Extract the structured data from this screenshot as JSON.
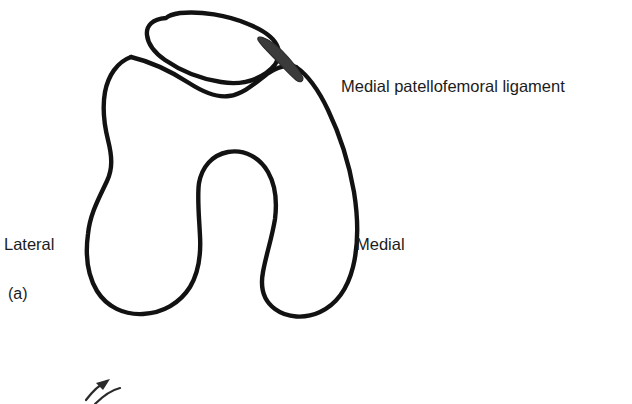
{
  "figure": {
    "panel_label": "(a)",
    "background_color": "#ffffff",
    "ink_color": "#121212",
    "ligament_color": "#3b3b3b",
    "width": 632,
    "height": 404
  },
  "labels": {
    "ligament": "Medial patellofemoral ligament",
    "lateral": "Lateral",
    "medial": "Medial"
  },
  "structures": {
    "patella": "patella",
    "femur": "distal-femur-axial-outline",
    "trochlear_groove": "trochlear-groove",
    "intercondylar_notch": "intercondylar-notch",
    "lateral_condyle": "lateral-condyle",
    "medial_condyle": "medial-condyle",
    "ligament_band": "medial-patellofemoral-ligament-band",
    "bottom_marker": "partial-arrow-marker"
  }
}
